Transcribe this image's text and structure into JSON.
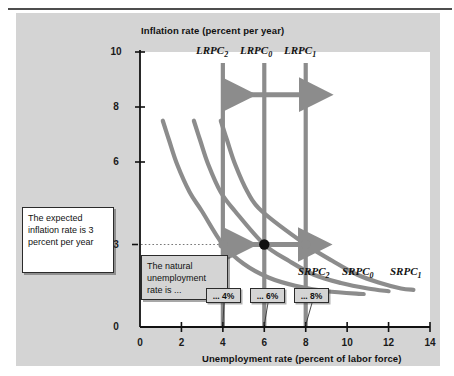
{
  "figure": {
    "name": "phillips-curve-shifts-figure",
    "background_color": "#d4d4d4",
    "plot_background_color": "#ffffff",
    "curve_color": "#8c8c8c",
    "arrow_color": "#8c8c8c",
    "equilibrium_dot_color": "#111111",
    "point_dot_color": "#8c8c8c"
  },
  "axes": {
    "y_title": "Inflation rate (percent per year)",
    "x_title": "Unemployment rate (percent of labor force)",
    "y_ticks": [
      "10",
      "8",
      "6",
      "3",
      "0"
    ],
    "y_tick_values": [
      10,
      8,
      6,
      3,
      0
    ],
    "x_ticks": [
      "0",
      "2",
      "4",
      "6",
      "8",
      "10",
      "12",
      "14"
    ],
    "x_tick_values": [
      0,
      2,
      4,
      6,
      8,
      10,
      12,
      14
    ]
  },
  "labels": {
    "lrpc": [
      {
        "base": "LRPC",
        "sub": "2",
        "x_value": 4
      },
      {
        "base": "LRPC",
        "sub": "0",
        "x_value": 6
      },
      {
        "base": "LRPC",
        "sub": "1",
        "x_value": 8
      }
    ],
    "srpc": [
      {
        "base": "SRPC",
        "sub": "2"
      },
      {
        "base": "SRPC",
        "sub": "0"
      },
      {
        "base": "SRPC",
        "sub": "1"
      }
    ]
  },
  "annotations": {
    "expected_inflation": "The expected inflation rate is 3 percent per year",
    "natural_rate": "The natural unemployment rate is ...",
    "pct_4": "... 4%",
    "pct_6": "... 6%",
    "pct_8": "... 8%"
  },
  "chart_data": {
    "type": "line",
    "title": "",
    "xlabel": "Unemployment rate (percent of labor force)",
    "ylabel": "Inflation rate (percent per year)",
    "xlim": [
      0,
      14
    ],
    "ylim": [
      0,
      10
    ],
    "grid": false,
    "legend_position": "inline-curve-labels",
    "expected_inflation_rate": 3,
    "vertical_lines": [
      {
        "name": "LRPC2",
        "x": 4,
        "label": "LRPC₂",
        "color": "#8c8c8c",
        "y_from": 0,
        "y_to": 9.6
      },
      {
        "name": "LRPC0",
        "x": 6,
        "label": "LRPC₀",
        "color": "#8c8c8c",
        "y_from": 0,
        "y_to": 9.6
      },
      {
        "name": "LRPC1",
        "x": 8,
        "label": "LRPC₁",
        "color": "#8c8c8c",
        "y_from": 0,
        "y_to": 9.6
      }
    ],
    "series": [
      {
        "name": "SRPC2",
        "label": "SRPC₂",
        "color": "#8c8c8c",
        "natural_rate": 4,
        "x": [
          1.1,
          1.4,
          1.8,
          2.4,
          3.0,
          4.0,
          5.0,
          6.2,
          7.5,
          9.0,
          10.8
        ],
        "y": [
          7.5,
          6.8,
          5.9,
          4.9,
          4.2,
          3.0,
          2.3,
          1.8,
          1.5,
          1.3,
          1.2
        ]
      },
      {
        "name": "SRPC0",
        "label": "SRPC₀",
        "color": "#8c8c8c",
        "natural_rate": 6,
        "x": [
          2.6,
          2.9,
          3.3,
          3.9,
          4.6,
          6.0,
          7.2,
          8.4,
          9.7,
          11.0,
          12.0
        ],
        "y": [
          7.5,
          6.8,
          5.9,
          4.9,
          4.2,
          3.0,
          2.4,
          1.9,
          1.6,
          1.4,
          1.3
        ]
      },
      {
        "name": "SRPC1",
        "label": "SRPC₁",
        "color": "#8c8c8c",
        "natural_rate": 8,
        "x": [
          3.9,
          4.2,
          4.6,
          5.2,
          5.9,
          8.0,
          9.3,
          10.5,
          11.6,
          12.6,
          13.2
        ],
        "y": [
          7.5,
          6.8,
          5.9,
          4.9,
          4.2,
          3.0,
          2.4,
          1.9,
          1.6,
          1.4,
          1.35
        ]
      }
    ],
    "points": [
      {
        "x": 4,
        "y": 3,
        "style": "gray-dot",
        "name": "equilibrium-4"
      },
      {
        "x": 6,
        "y": 3,
        "style": "black-dot",
        "name": "equilibrium-6"
      },
      {
        "x": 8,
        "y": 3,
        "style": "gray-dot",
        "name": "equilibrium-8"
      }
    ],
    "arrows": [
      {
        "name": "top-left-arrow",
        "from_x": 6,
        "to_x": 4.15,
        "y": 8.45,
        "direction": "left"
      },
      {
        "name": "top-right-arrow",
        "from_x": 6,
        "to_x": 7.85,
        "y": 8.45,
        "direction": "right"
      },
      {
        "name": "mid-left-arrow",
        "from_x": 6,
        "to_x": 4.2,
        "y": 3,
        "direction": "left"
      },
      {
        "name": "mid-right-arrow",
        "from_x": 6,
        "to_x": 7.8,
        "y": 3,
        "direction": "right"
      }
    ],
    "reference_line": {
      "name": "expected-inflation-guideline",
      "y": 3,
      "style": "dotted",
      "x_from": 0.05,
      "x_to": 8
    }
  }
}
